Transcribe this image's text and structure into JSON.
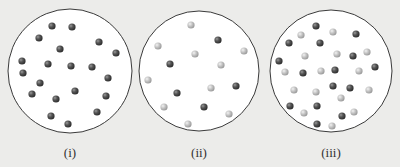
{
  "colors": {
    "background": "#ececea",
    "circle_fill": "#ffffff",
    "circle_stroke": "#3a3a3a",
    "dark_particle": "#4a4a4a",
    "light_particle": "#bdbdbd"
  },
  "panels": [
    {
      "label": "(i)",
      "cx": 70,
      "cy": 71,
      "r": 62,
      "label_x": 70,
      "label_y": 145,
      "particles": [
        {
          "x": 52,
          "y": 26,
          "t": "dark"
        },
        {
          "x": 72,
          "y": 27,
          "t": "dark"
        },
        {
          "x": 39,
          "y": 38,
          "t": "dark"
        },
        {
          "x": 99,
          "y": 42,
          "t": "dark"
        },
        {
          "x": 60,
          "y": 49,
          "t": "dark"
        },
        {
          "x": 116,
          "y": 53,
          "t": "dark"
        },
        {
          "x": 22,
          "y": 61,
          "t": "dark"
        },
        {
          "x": 48,
          "y": 64,
          "t": "dark"
        },
        {
          "x": 71,
          "y": 66,
          "t": "dark"
        },
        {
          "x": 92,
          "y": 67,
          "t": "dark"
        },
        {
          "x": 23,
          "y": 73,
          "t": "dark"
        },
        {
          "x": 108,
          "y": 78,
          "t": "dark"
        },
        {
          "x": 40,
          "y": 83,
          "t": "dark"
        },
        {
          "x": 75,
          "y": 91,
          "t": "dark"
        },
        {
          "x": 32,
          "y": 94,
          "t": "dark"
        },
        {
          "x": 56,
          "y": 99,
          "t": "dark"
        },
        {
          "x": 106,
          "y": 96,
          "t": "dark"
        },
        {
          "x": 97,
          "y": 112,
          "t": "dark"
        },
        {
          "x": 51,
          "y": 116,
          "t": "dark"
        },
        {
          "x": 68,
          "y": 124,
          "t": "dark"
        }
      ]
    },
    {
      "label": "(ii)",
      "cx": 199,
      "cy": 71,
      "r": 60,
      "label_x": 199,
      "label_y": 145,
      "particles": [
        {
          "x": 191,
          "y": 25,
          "t": "light"
        },
        {
          "x": 218,
          "y": 40,
          "t": "dark"
        },
        {
          "x": 158,
          "y": 46,
          "t": "light"
        },
        {
          "x": 244,
          "y": 51,
          "t": "light"
        },
        {
          "x": 195,
          "y": 54,
          "t": "light"
        },
        {
          "x": 170,
          "y": 64,
          "t": "dark"
        },
        {
          "x": 221,
          "y": 65,
          "t": "light"
        },
        {
          "x": 148,
          "y": 80,
          "t": "light"
        },
        {
          "x": 236,
          "y": 86,
          "t": "dark"
        },
        {
          "x": 211,
          "y": 88,
          "t": "light"
        },
        {
          "x": 177,
          "y": 93,
          "t": "dark"
        },
        {
          "x": 164,
          "y": 107,
          "t": "light"
        },
        {
          "x": 204,
          "y": 107,
          "t": "dark"
        },
        {
          "x": 229,
          "y": 114,
          "t": "light"
        },
        {
          "x": 188,
          "y": 124,
          "t": "light"
        }
      ]
    },
    {
      "label": "(iii)",
      "cx": 331,
      "cy": 71,
      "r": 61,
      "label_x": 331,
      "label_y": 145,
      "particles": [
        {
          "x": 316,
          "y": 26,
          "t": "dark"
        },
        {
          "x": 333,
          "y": 32,
          "t": "light"
        },
        {
          "x": 356,
          "y": 34,
          "t": "dark"
        },
        {
          "x": 301,
          "y": 35,
          "t": "light"
        },
        {
          "x": 289,
          "y": 43,
          "t": "dark"
        },
        {
          "x": 320,
          "y": 43,
          "t": "dark"
        },
        {
          "x": 305,
          "y": 56,
          "t": "light"
        },
        {
          "x": 337,
          "y": 54,
          "t": "light"
        },
        {
          "x": 353,
          "y": 56,
          "t": "dark"
        },
        {
          "x": 367,
          "y": 52,
          "t": "light"
        },
        {
          "x": 279,
          "y": 61,
          "t": "dark"
        },
        {
          "x": 285,
          "y": 72,
          "t": "light"
        },
        {
          "x": 303,
          "y": 73,
          "t": "dark"
        },
        {
          "x": 321,
          "y": 71,
          "t": "light"
        },
        {
          "x": 335,
          "y": 70,
          "t": "dark"
        },
        {
          "x": 359,
          "y": 71,
          "t": "light"
        },
        {
          "x": 375,
          "y": 67,
          "t": "dark"
        },
        {
          "x": 294,
          "y": 90,
          "t": "light"
        },
        {
          "x": 316,
          "y": 92,
          "t": "light"
        },
        {
          "x": 333,
          "y": 86,
          "t": "dark"
        },
        {
          "x": 350,
          "y": 88,
          "t": "dark"
        },
        {
          "x": 369,
          "y": 90,
          "t": "light"
        },
        {
          "x": 341,
          "y": 98,
          "t": "light"
        },
        {
          "x": 290,
          "y": 106,
          "t": "dark"
        },
        {
          "x": 304,
          "y": 113,
          "t": "light"
        },
        {
          "x": 317,
          "y": 106,
          "t": "dark"
        },
        {
          "x": 342,
          "y": 116,
          "t": "dark"
        },
        {
          "x": 354,
          "y": 112,
          "t": "light"
        },
        {
          "x": 317,
          "y": 124,
          "t": "dark"
        },
        {
          "x": 332,
          "y": 126,
          "t": "light"
        }
      ]
    }
  ]
}
